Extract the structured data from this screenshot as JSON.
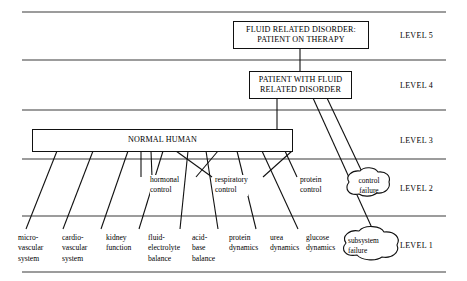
{
  "figure": {
    "title_nodes": {
      "level5_box": {
        "lines": [
          "FLUID RELATED DISORDER:",
          "PATIENT ON THERAPY"
        ]
      },
      "level4_box": {
        "lines": [
          "PATIENT WITH FLUID",
          "RELATED DISORDER"
        ]
      },
      "level3_box": {
        "lines": [
          "NORMAL HUMAN"
        ]
      }
    },
    "level_labels": [
      {
        "id": "level-5",
        "text": "LEVEL 5"
      },
      {
        "id": "level-4",
        "text": "LEVEL 4"
      },
      {
        "id": "level-3",
        "text": "LEVEL 3"
      },
      {
        "id": "level-2",
        "text": "LEVEL 2"
      },
      {
        "id": "level-1",
        "text": "LEVEL 1"
      }
    ],
    "level2_controls": [
      {
        "id": "hormonal-control",
        "lines": [
          "hormonal",
          "control"
        ]
      },
      {
        "id": "respiratory-control",
        "lines": [
          "respiratory",
          "control"
        ]
      },
      {
        "id": "protein-control",
        "lines": [
          "protein",
          "control"
        ]
      }
    ],
    "level2_failure": {
      "id": "control-failure",
      "lines": [
        "control",
        "failure"
      ]
    },
    "level1_failure": {
      "id": "subsystem-failure",
      "lines": [
        "subsystem",
        "failure"
      ]
    },
    "level1_leaves": [
      {
        "id": "micro-vascular-system",
        "lines": [
          "micro-",
          "vascular",
          "system"
        ]
      },
      {
        "id": "cardio-vascular-system",
        "lines": [
          "cardio-",
          "vascular",
          "system"
        ]
      },
      {
        "id": "kidney-function",
        "lines": [
          "kidney",
          "function"
        ]
      },
      {
        "id": "fluid-electrolyte-balance",
        "lines": [
          "fluid-",
          "electrolyte",
          "balance"
        ]
      },
      {
        "id": "acid-base-balance",
        "lines": [
          "acid-",
          "base",
          "balance"
        ]
      },
      {
        "id": "protein-dynamics",
        "lines": [
          "protein",
          "dynamics"
        ]
      },
      {
        "id": "urea-dynamics",
        "lines": [
          "urea",
          "dynamics"
        ]
      },
      {
        "id": "glucose-dynamics",
        "lines": [
          "glucose",
          "dynamics"
        ]
      }
    ],
    "colors": {
      "line": "#111111",
      "separator": "#3a3a3a",
      "background": "#ffffff"
    }
  }
}
